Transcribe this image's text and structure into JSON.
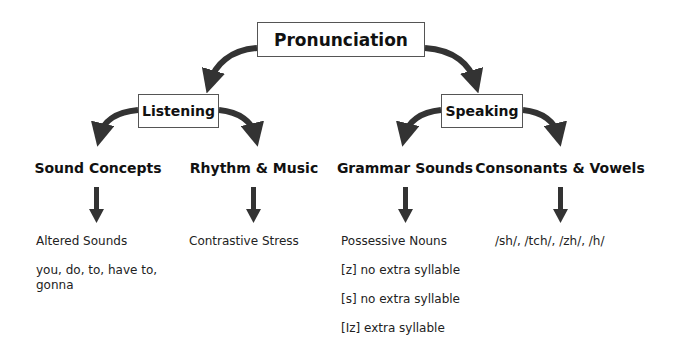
{
  "diagram": {
    "root": {
      "label": "Pronunciation"
    },
    "branches": [
      {
        "label": "Listening",
        "topics": [
          {
            "label": "Sound Concepts",
            "details": [
              "Altered Sounds",
              "you, do, to, have to, gonna"
            ]
          },
          {
            "label": "Rhythm & Music",
            "details": [
              "Contrastive Stress"
            ]
          }
        ]
      },
      {
        "label": "Speaking",
        "topics": [
          {
            "label": "Grammar Sounds",
            "details": [
              "Possessive Nouns",
              "[z] no extra syllable",
              "[s] no extra syllable",
              "[Iz] extra syllable"
            ]
          },
          {
            "label": "Consonants & Vowels",
            "details": [
              "/sh/, /tch/, /zh/, /h/"
            ]
          }
        ]
      }
    ],
    "colors": {
      "arrow": "#333333",
      "box_border": "#555555",
      "text": "#111111"
    }
  }
}
